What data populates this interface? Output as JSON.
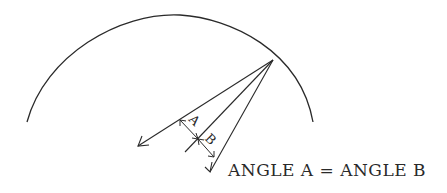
{
  "diagram": {
    "labels": {
      "angle_a": "A",
      "angle_b": "B"
    },
    "caption": "ANGLE A = ANGLE B",
    "stroke_color": "#2a2a2a",
    "background": "#ffffff"
  }
}
